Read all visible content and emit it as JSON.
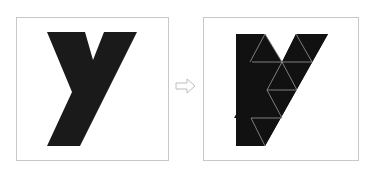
{
  "diagram": {
    "left_panel": {
      "label": "solid-letter-y",
      "shape_color": "#1a1a1a"
    },
    "arrow": {
      "direction": "right",
      "color": "#bdbdbd"
    },
    "right_panel": {
      "label": "triangulated-letter-y",
      "shape_color": "#111111",
      "grid_line_color": "#9a9a9a"
    },
    "panel_border_color": "#c8c8c8"
  }
}
